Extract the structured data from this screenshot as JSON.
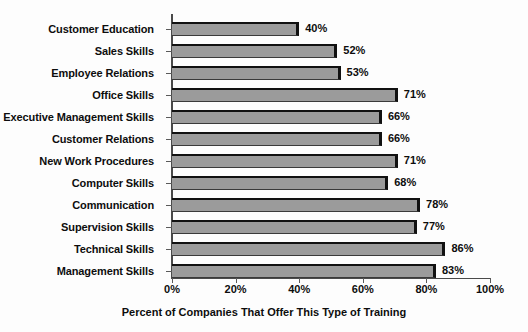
{
  "chart_data": {
    "type": "bar",
    "orientation": "horizontal",
    "title": "",
    "xlabel": "Percent of Companies That Offer This Type of Training",
    "ylabel": "",
    "xlim": [
      0,
      100
    ],
    "xticks": [
      "0%",
      "20%",
      "40%",
      "60%",
      "80%",
      "100%"
    ],
    "xtick_values": [
      0,
      20,
      40,
      60,
      80,
      100
    ],
    "grid": false,
    "legend": false,
    "categories": [
      "Customer Education",
      "Sales Skills",
      "Employee Relations",
      "Office Skills",
      "Executive Management Skills",
      "Customer Relations",
      "New Work Procedures",
      "Computer Skills",
      "Communication",
      "Supervision Skills",
      "Technical Skills",
      "Management Skills"
    ],
    "values": [
      40,
      52,
      53,
      71,
      66,
      66,
      71,
      68,
      78,
      77,
      86,
      83
    ],
    "data_labels": [
      "40%",
      "52%",
      "53%",
      "71%",
      "66%",
      "66%",
      "71%",
      "68%",
      "78%",
      "77%",
      "86%",
      "83%"
    ],
    "bar_fill_color": "#9b9b9b",
    "bar_edge_color": "#111111",
    "background_color": "#fdfdfd",
    "axis_color": "#4a4a4a"
  }
}
